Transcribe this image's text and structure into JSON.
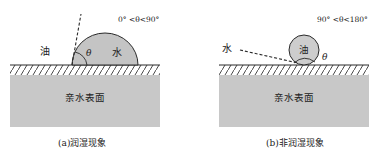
{
  "colors": {
    "substrate": "#c8c8c8",
    "water_drop": "#c4c4c4",
    "oil_drop": "#cdcdcd",
    "line": "#2a2a2a",
    "background": "#ffffff"
  },
  "panels": [
    {
      "id": "a",
      "caption": "(a)润湿现象",
      "angle_range": "0° <θ<90°",
      "surface_label": "亲水表面",
      "surrounding_phase_label": "油",
      "droplet_label": "水",
      "angle_symbol": "θ"
    },
    {
      "id": "b",
      "caption": "(b)非润湿现象",
      "angle_range": "90° <θ<180°",
      "surface_label": "亲水表面",
      "surrounding_phase_label": "水",
      "droplet_label": "油",
      "angle_symbol": "θ"
    }
  ]
}
